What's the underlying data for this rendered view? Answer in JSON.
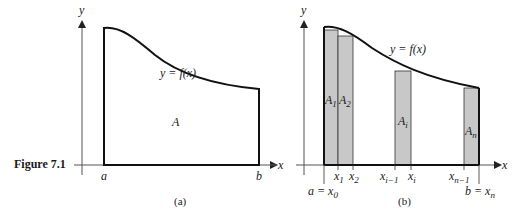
{
  "figure": {
    "caption": "Figure 7.1",
    "panel_a": {
      "label": "(a)",
      "y_axis": "y",
      "curve_label": "y = f(x)",
      "area_label": "A",
      "x_left": "a",
      "x_right": "b"
    },
    "panel_b": {
      "label": "(b)",
      "y_axis": "y",
      "x_axis": "x",
      "curve_label": "y = f(x)",
      "rects": [
        {
          "label": "A",
          "sub": "1"
        },
        {
          "label": "A",
          "sub": "2"
        },
        {
          "label": "A",
          "sub": "i"
        },
        {
          "label": "A",
          "sub": "n"
        }
      ],
      "ticks": [
        {
          "main": "x",
          "sub": "1"
        },
        {
          "main": "x",
          "sub": "2"
        },
        {
          "main": "x",
          "sub": "i−1"
        },
        {
          "main": "x",
          "sub": "i"
        },
        {
          "main": "x",
          "sub": "n−1"
        }
      ],
      "a_label": "a = x",
      "a_sub": "0",
      "b_label": "b = x",
      "b_sub": "n"
    },
    "colors": {
      "fill": "#c8c8c8",
      "stroke": "#111111"
    }
  }
}
